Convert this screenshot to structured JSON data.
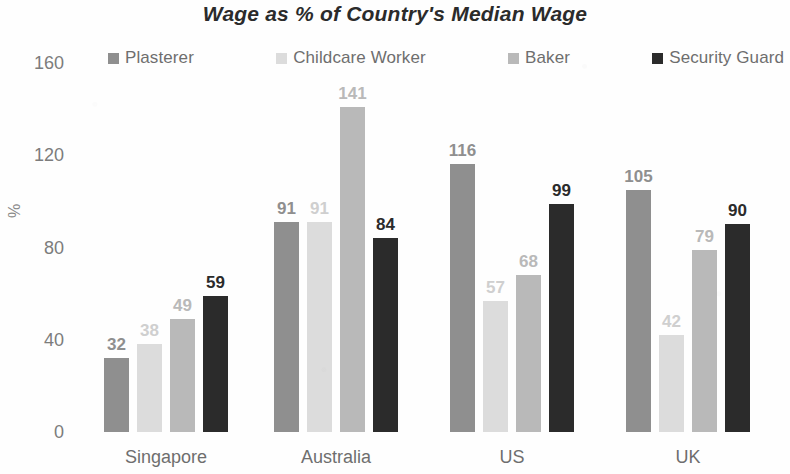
{
  "chart_data": {
    "type": "bar",
    "title": "Wage as % of Country's Median Wage",
    "xlabel": "",
    "ylabel": "%",
    "ylim": [
      0,
      160
    ],
    "yticks": [
      0,
      40,
      80,
      120,
      160
    ],
    "grid": false,
    "legend_position": "top",
    "categories": [
      "Singapore",
      "Australia",
      "US",
      "UK"
    ],
    "series": [
      {
        "name": "Plasterer",
        "color": "#8f8f8f",
        "values": [
          32,
          91,
          116,
          105
        ]
      },
      {
        "name": "Childcare Worker",
        "color": "#dcdcdc",
        "values": [
          38,
          91,
          57,
          42
        ]
      },
      {
        "name": "Baker",
        "color": "#b9b9b9",
        "values": [
          49,
          141,
          68,
          79
        ]
      },
      {
        "name": "Security Guard",
        "color": "#2b2b2b",
        "values": [
          59,
          84,
          99,
          90
        ]
      }
    ]
  },
  "colors": {
    "background": "#fefefe",
    "title_text": "#2b2b2b",
    "axis_text": "#7c7c7c",
    "category_text": "#6e6e6e",
    "legend_text": "#6e6e6e"
  }
}
